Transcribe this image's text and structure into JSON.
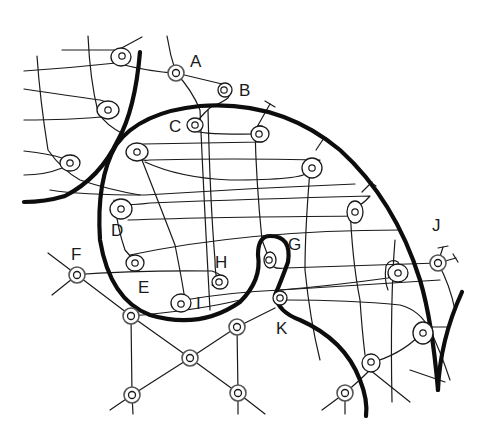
{
  "diagram": {
    "type": "schematic network of fibers with terminal loops and nodes",
    "labels": {
      "A": "A",
      "B": "B",
      "C": "C",
      "D": "D",
      "E": "E",
      "F": "F",
      "G": "G",
      "H": "H",
      "I": "I",
      "J": "J",
      "K": "K"
    },
    "label_positions": {
      "A": [
        196,
        66
      ],
      "B": [
        239,
        96
      ],
      "C": [
        168,
        132
      ],
      "D": [
        112,
        236
      ],
      "E": [
        138,
        293
      ],
      "F": [
        70,
        260
      ],
      "G": [
        288,
        250
      ],
      "H": [
        215,
        268
      ],
      "I": [
        196,
        309
      ],
      "J": [
        431,
        231
      ],
      "K": [
        276,
        334
      ]
    },
    "colors": {
      "ink": "#1a1a1a",
      "background": "#ffffff",
      "node_ring": "#555555"
    }
  }
}
